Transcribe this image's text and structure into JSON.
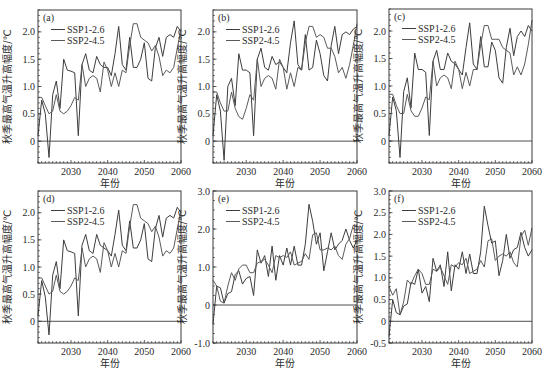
{
  "figure": {
    "ylabel": "秋季最高气温升高幅度/℃",
    "xlabel": "年份",
    "legend": [
      "SSP1-2.6",
      "SSP2-4.5"
    ]
  },
  "chart_data": [
    {
      "type": "line",
      "panel": "(a)",
      "xlabel": "年份",
      "ylabel": "秋季最高气温升高幅度/℃",
      "xlim": [
        2021,
        2060
      ],
      "ylim": [
        -0.4,
        2.4
      ],
      "xticks": [
        2030,
        2040,
        2050,
        2060
      ],
      "yticks": [
        0,
        0.5,
        1.0,
        1.5,
        2.0
      ],
      "ytick_labels": [
        "0",
        "0.5",
        "1.0",
        "1.5",
        "2.0"
      ],
      "grid": false,
      "legend_position": "upper left",
      "x": [
        2021,
        2022,
        2023,
        2024,
        2025,
        2026,
        2027,
        2028,
        2029,
        2030,
        2031,
        2032,
        2033,
        2034,
        2035,
        2036,
        2037,
        2038,
        2039,
        2040,
        2041,
        2042,
        2043,
        2044,
        2045,
        2046,
        2047,
        2048,
        2049,
        2050,
        2051,
        2052,
        2053,
        2054,
        2055,
        2056,
        2057,
        2058,
        2059,
        2060
      ],
      "series": [
        {
          "name": "SSP1-2.6",
          "values": [
            0.1,
            0.75,
            0.5,
            -0.3,
            0.85,
            1.1,
            0.6,
            1.5,
            1.3,
            1.28,
            1.25,
            0.1,
            1.4,
            1.6,
            1.3,
            1.25,
            1.55,
            1.4,
            1.35,
            1.35,
            1.2,
            1.6,
            2.1,
            1.4,
            1.3,
            1.9,
            1.35,
            1.35,
            1.5,
            1.8,
            1.15,
            1.1,
            1.7,
            1.9,
            1.55,
            1.9,
            1.95,
            1.9,
            2.1,
            2.0
          ]
        },
        {
          "name": "SSP2-4.5",
          "values": [
            0.8,
            0.8,
            0.65,
            0.5,
            0.55,
            0.85,
            0.55,
            0.5,
            0.55,
            0.65,
            0.8,
            0.75,
            1.4,
            1.0,
            1.15,
            1.2,
            1.15,
            0.9,
            1.45,
            1.3,
            1.0,
            1.25,
            1.0,
            1.3,
            1.25,
            1.75,
            2.15,
            2.15,
            1.9,
            1.85,
            1.8,
            1.65,
            1.75,
            1.55,
            1.2,
            1.3,
            1.25,
            1.35,
            1.7,
            2.05
          ]
        }
      ]
    },
    {
      "type": "line",
      "panel": "(b)",
      "xlabel": "年份",
      "ylabel": "秋季最高气温升高幅度/℃",
      "xlim": [
        2021,
        2060
      ],
      "ylim": [
        -0.4,
        2.4
      ],
      "xticks": [
        2030,
        2040,
        2050,
        2060
      ],
      "yticks": [
        0,
        0.5,
        1.0,
        1.5,
        2.0
      ],
      "ytick_labels": [
        "0",
        "0.5",
        "1.0",
        "1.5",
        "2.0"
      ],
      "grid": false,
      "legend_position": "upper left",
      "x": [
        2021,
        2022,
        2023,
        2024,
        2025,
        2026,
        2027,
        2028,
        2029,
        2030,
        2031,
        2032,
        2033,
        2034,
        2035,
        2036,
        2037,
        2038,
        2039,
        2040,
        2041,
        2042,
        2043,
        2044,
        2045,
        2046,
        2047,
        2048,
        2049,
        2050,
        2051,
        2052,
        2053,
        2054,
        2055,
        2056,
        2057,
        2058,
        2059,
        2060
      ],
      "series": [
        {
          "name": "SSP1-2.6",
          "values": [
            0.1,
            0.85,
            0.55,
            -0.35,
            1.0,
            1.15,
            0.65,
            1.6,
            1.3,
            1.3,
            1.25,
            0.1,
            1.5,
            1.7,
            1.35,
            1.3,
            1.55,
            1.4,
            1.45,
            1.35,
            1.25,
            1.8,
            2.2,
            1.4,
            1.3,
            1.95,
            1.3,
            1.35,
            1.85,
            1.6,
            1.2,
            1.1,
            1.75,
            2.1,
            1.6,
            1.95,
            2.0,
            1.95,
            2.05,
            2.1
          ]
        },
        {
          "name": "SSP2-4.5",
          "values": [
            0.9,
            0.9,
            0.7,
            0.55,
            0.55,
            0.9,
            0.6,
            0.45,
            0.4,
            0.6,
            0.85,
            0.75,
            1.5,
            1.0,
            1.15,
            1.2,
            1.15,
            0.95,
            1.5,
            1.35,
            0.95,
            1.25,
            1.0,
            1.35,
            1.3,
            1.8,
            2.1,
            2.1,
            1.9,
            1.95,
            1.9,
            1.7,
            1.7,
            1.55,
            1.25,
            1.35,
            1.15,
            1.4,
            1.75,
            2.15
          ]
        }
      ]
    },
    {
      "type": "line",
      "panel": "(c)",
      "xlabel": "年份",
      "ylabel": "秋季最高气温升高幅度/℃",
      "xlim": [
        2021,
        2060
      ],
      "ylim": [
        -0.4,
        2.4
      ],
      "xticks": [
        2030,
        2040,
        2050,
        2060
      ],
      "yticks": [
        0,
        0.5,
        1.0,
        1.5,
        2.0
      ],
      "ytick_labels": [
        "0",
        "0.5",
        "1.0",
        "1.5",
        "2.0"
      ],
      "grid": false,
      "legend_position": "upper left",
      "x": [
        2021,
        2022,
        2023,
        2024,
        2025,
        2026,
        2027,
        2028,
        2029,
        2030,
        2031,
        2032,
        2033,
        2034,
        2035,
        2036,
        2037,
        2038,
        2039,
        2040,
        2041,
        2042,
        2043,
        2044,
        2045,
        2046,
        2047,
        2048,
        2049,
        2050,
        2051,
        2052,
        2053,
        2054,
        2055,
        2056,
        2057,
        2058,
        2059,
        2060
      ],
      "series": [
        {
          "name": "SSP1-2.6",
          "values": [
            0.1,
            0.8,
            0.55,
            -0.3,
            0.9,
            1.15,
            0.6,
            1.6,
            1.3,
            1.3,
            1.25,
            0.1,
            1.45,
            1.65,
            1.3,
            1.3,
            1.6,
            1.45,
            1.4,
            1.3,
            1.2,
            1.7,
            2.15,
            1.4,
            1.3,
            1.9,
            1.35,
            1.35,
            1.8,
            1.65,
            1.15,
            1.05,
            1.7,
            2.05,
            1.55,
            1.9,
            2.0,
            1.9,
            2.1,
            2.0
          ]
        },
        {
          "name": "SSP2-4.5",
          "values": [
            0.85,
            0.85,
            0.65,
            0.5,
            0.5,
            0.85,
            0.55,
            0.45,
            0.45,
            0.6,
            0.8,
            0.75,
            1.45,
            1.0,
            1.15,
            1.2,
            1.15,
            0.95,
            1.45,
            1.3,
            0.95,
            1.25,
            1.0,
            1.3,
            1.3,
            1.75,
            2.1,
            2.1,
            1.85,
            1.85,
            1.85,
            1.7,
            1.65,
            1.6,
            1.2,
            1.35,
            1.2,
            1.4,
            1.75,
            2.2
          ]
        }
      ]
    },
    {
      "type": "line",
      "panel": "(d)",
      "xlabel": "年份",
      "ylabel": "秋季最高气温升高幅度/℃",
      "xlim": [
        2021,
        2060
      ],
      "ylim": [
        -0.4,
        2.4
      ],
      "xticks": [
        2030,
        2040,
        2050,
        2060
      ],
      "yticks": [
        0,
        0.5,
        1.0,
        1.5,
        2.0
      ],
      "ytick_labels": [
        "0",
        "0.5",
        "1.0",
        "1.5",
        "2.0"
      ],
      "grid": false,
      "legend_position": "upper left",
      "x": [
        2021,
        2022,
        2023,
        2024,
        2025,
        2026,
        2027,
        2028,
        2029,
        2030,
        2031,
        2032,
        2033,
        2034,
        2035,
        2036,
        2037,
        2038,
        2039,
        2040,
        2041,
        2042,
        2043,
        2044,
        2045,
        2046,
        2047,
        2048,
        2049,
        2050,
        2051,
        2052,
        2053,
        2054,
        2055,
        2056,
        2057,
        2058,
        2059,
        2060
      ],
      "series": [
        {
          "name": "SSP1-2.6",
          "values": [
            0.1,
            0.75,
            0.45,
            -0.25,
            0.85,
            1.1,
            0.6,
            1.5,
            1.3,
            1.28,
            1.25,
            0.1,
            1.4,
            1.6,
            1.3,
            1.25,
            1.6,
            1.4,
            1.35,
            1.3,
            1.2,
            1.6,
            2.05,
            1.4,
            1.3,
            1.85,
            1.35,
            1.35,
            1.5,
            1.8,
            1.15,
            1.1,
            1.7,
            1.95,
            1.55,
            1.9,
            1.95,
            1.9,
            2.1,
            2.0
          ]
        },
        {
          "name": "SSP2-4.5",
          "values": [
            0.8,
            0.8,
            0.65,
            0.5,
            0.55,
            0.85,
            0.55,
            0.5,
            0.55,
            0.65,
            0.8,
            0.75,
            1.35,
            1.0,
            1.15,
            1.2,
            1.15,
            0.9,
            1.45,
            1.3,
            1.0,
            1.25,
            1.0,
            1.3,
            1.25,
            1.75,
            2.15,
            2.15,
            1.9,
            1.85,
            1.8,
            1.65,
            1.75,
            1.55,
            1.2,
            1.3,
            1.25,
            1.35,
            1.7,
            2.05
          ]
        }
      ]
    },
    {
      "type": "line",
      "panel": "(e)",
      "xlabel": "年份",
      "ylabel": "秋季最高气温升高幅度/℃",
      "xlim": [
        2021,
        2060
      ],
      "ylim": [
        -1.0,
        3.0
      ],
      "xticks": [
        2030,
        2040,
        2050,
        2060
      ],
      "yticks": [
        -1.0,
        0,
        1.0,
        2.0,
        3.0
      ],
      "ytick_labels": [
        "-1.0",
        "0",
        "1.0",
        "2.0",
        "3.0"
      ],
      "grid": false,
      "legend_position": "upper left",
      "x": [
        2021,
        2022,
        2023,
        2024,
        2025,
        2026,
        2027,
        2028,
        2029,
        2030,
        2031,
        2032,
        2033,
        2034,
        2035,
        2036,
        2037,
        2038,
        2039,
        2040,
        2041,
        2042,
        2043,
        2044,
        2045,
        2046,
        2047,
        2048,
        2049,
        2050,
        2051,
        2052,
        2053,
        2054,
        2055,
        2056,
        2057,
        2058,
        2059,
        2060
      ],
      "series": [
        {
          "name": "SSP1-2.6",
          "values": [
            -0.5,
            0.5,
            0.45,
            0.05,
            0.3,
            0.35,
            0.8,
            0.9,
            0.55,
            0.7,
            0.75,
            0.25,
            1.45,
            1.1,
            1.3,
            0.75,
            1.55,
            0.65,
            1.3,
            1.05,
            1.5,
            1.05,
            1.55,
            1.05,
            1.05,
            1.6,
            2.65,
            2.2,
            1.6,
            1.9,
            0.9,
            1.4,
            1.9,
            1.45,
            1.6,
            1.7,
            2.0,
            1.7,
            1.5,
            1.7
          ]
        },
        {
          "name": "SSP2-4.5",
          "values": [
            0.65,
            0.5,
            0.1,
            0.05,
            0.5,
            0.85,
            0.65,
            0.95,
            1.05,
            1.05,
            0.85,
            0.85,
            1.1,
            1.15,
            1.2,
            1.05,
            0.85,
            1.3,
            1.25,
            1.3,
            1.25,
            1.4,
            1.05,
            1.1,
            1.15,
            1.35,
            1.2,
            1.85,
            1.9,
            1.45,
            1.45,
            1.5,
            1.45,
            1.55,
            1.3,
            1.2,
            1.6,
            1.75,
            2.1,
            2.1
          ]
        }
      ]
    },
    {
      "type": "line",
      "panel": "(f)",
      "xlabel": "年份",
      "ylabel": "秋季最高气温升高幅度/℃",
      "xlim": [
        2021,
        2060
      ],
      "ylim": [
        -0.5,
        3.0
      ],
      "xticks": [
        2030,
        2040,
        2050,
        2060
      ],
      "yticks": [
        -0.5,
        0,
        0.5,
        1.0,
        1.5,
        2.0,
        2.5,
        3.0
      ],
      "ytick_labels": [
        "-0.5",
        "0",
        "0.5",
        "1.0",
        "1.5",
        "2.0",
        "2.5",
        "3.0"
      ],
      "grid": false,
      "legend_position": "upper left",
      "x": [
        2021,
        2022,
        2023,
        2024,
        2025,
        2026,
        2027,
        2028,
        2029,
        2030,
        2031,
        2032,
        2033,
        2034,
        2035,
        2036,
        2037,
        2038,
        2039,
        2040,
        2041,
        2042,
        2043,
        2044,
        2045,
        2046,
        2047,
        2048,
        2049,
        2050,
        2051,
        2052,
        2053,
        2054,
        2055,
        2056,
        2057,
        2058,
        2059,
        2060
      ],
      "series": [
        {
          "name": "SSP1-2.6",
          "values": [
            -0.35,
            0.5,
            0.2,
            0.15,
            0.35,
            0.4,
            0.9,
            0.85,
            1.2,
            0.65,
            0.8,
            0.45,
            1.45,
            1.15,
            1.3,
            0.8,
            1.6,
            0.7,
            1.3,
            1.2,
            1.6,
            1.1,
            1.55,
            1.1,
            1.1,
            1.6,
            2.65,
            2.2,
            1.8,
            1.85,
            1.05,
            1.4,
            2.0,
            1.45,
            1.65,
            1.7,
            2.05,
            1.7,
            1.5,
            1.65
          ]
        },
        {
          "name": "SSP2-4.5",
          "values": [
            0.8,
            0.6,
            0.75,
            0.15,
            0.45,
            0.95,
            0.85,
            1.05,
            1.2,
            1.1,
            0.85,
            0.85,
            1.2,
            1.15,
            1.25,
            1.05,
            0.85,
            1.3,
            1.25,
            1.35,
            1.3,
            1.45,
            1.1,
            1.15,
            1.2,
            1.4,
            1.25,
            1.85,
            1.9,
            1.4,
            1.5,
            1.55,
            1.5,
            1.6,
            1.35,
            1.25,
            1.95,
            2.1,
            1.75,
            2.15
          ]
        }
      ]
    }
  ]
}
